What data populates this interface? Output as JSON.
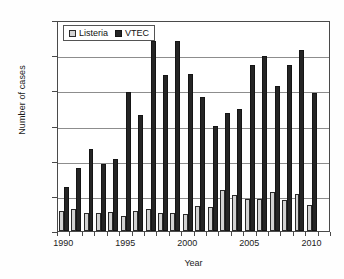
{
  "chart_data": {
    "type": "bar",
    "title": "",
    "xlabel": "Year",
    "ylabel": "Number of cases",
    "ylim": [
      0,
      1200
    ],
    "ytick_step": 200,
    "yticks": [
      0,
      200,
      400,
      600,
      800,
      1000,
      1200
    ],
    "xticks": [
      1990,
      1995,
      2000,
      2005,
      2010
    ],
    "grid": "horizontal",
    "legend_position": "top-left",
    "categories": [
      1990,
      1991,
      1992,
      1993,
      1994,
      1995,
      1996,
      1997,
      1998,
      1999,
      2000,
      2001,
      2002,
      2003,
      2004,
      2005,
      2006,
      2007,
      2008,
      2009,
      2010,
      2011
    ],
    "series": [
      {
        "name": "Listeria",
        "color": "#d2d2d2",
        "values": [
          115,
          128,
          104,
          100,
          110,
          88,
          116,
          124,
          104,
          104,
          98,
          142,
          138,
          231,
          206,
          184,
          180,
          221,
          178,
          209,
          150,
          0
        ]
      },
      {
        "name": "VTEC",
        "color": "#252525",
        "values": [
          249,
          360,
          469,
          383,
          411,
          792,
          659,
          1082,
          888,
          1079,
          893,
          762,
          595,
          671,
          694,
          946,
          995,
          823,
          945,
          1031,
          787,
          0
        ]
      }
    ],
    "legend": [
      {
        "label": "Listeria",
        "swatch": "light-gray-square"
      },
      {
        "label": "VTEC",
        "swatch": "black-square"
      }
    ]
  }
}
